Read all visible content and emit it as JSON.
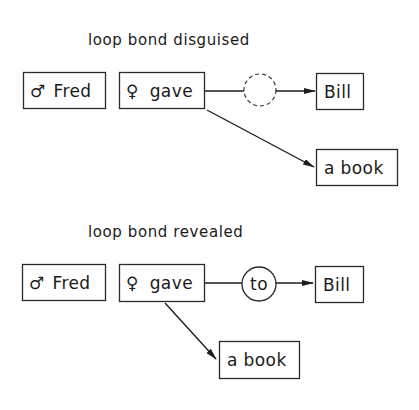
{
  "diagrams": [
    {
      "title": "loop bond disguised",
      "nodes": {
        "fred": {
          "symbol": "♂",
          "text": "Fred"
        },
        "gave": {
          "symbol": "♀",
          "text": "gave"
        },
        "bill": {
          "text": "Bill"
        },
        "book": {
          "text": "a book"
        },
        "loop": {
          "text": "",
          "style": "dashed"
        }
      }
    },
    {
      "title": "loop bond revealed",
      "nodes": {
        "fred": {
          "symbol": "♂",
          "text": "Fred"
        },
        "gave": {
          "symbol": "♀",
          "text": "gave"
        },
        "bill": {
          "text": "Bill"
        },
        "book": {
          "text": "a book"
        },
        "loop": {
          "text": "to",
          "style": "solid"
        }
      }
    }
  ],
  "colors": {
    "stroke": "#2a2a2a",
    "background": "#ffffff"
  }
}
